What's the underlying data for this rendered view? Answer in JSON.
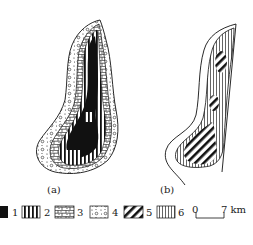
{
  "figure": {
    "panels": [
      {
        "id": "a",
        "label": "(a)"
      },
      {
        "id": "b",
        "label": "(b)"
      }
    ],
    "legend": {
      "items": [
        {
          "number": "1",
          "pattern": "solid-black"
        },
        {
          "number": "2",
          "pattern": "vertical-bold-lines"
        },
        {
          "number": "3",
          "pattern": "brick-dots"
        },
        {
          "number": "4",
          "pattern": "dots-circles"
        },
        {
          "number": "5",
          "pattern": "diagonal-bold-stripes"
        },
        {
          "number": "6",
          "pattern": "vertical-thin-lines"
        }
      ]
    },
    "scale_bar": {
      "start": "0",
      "end": "7 km"
    }
  }
}
